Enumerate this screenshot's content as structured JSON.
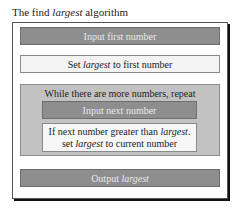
{
  "title": {
    "prefix": "The find ",
    "em": "largest",
    "suffix": " algorithm"
  },
  "steps": [
    {
      "label": "Input first number"
    },
    {
      "prefix": "Set ",
      "em": "largest",
      "suffix": " to first number"
    },
    {
      "loop_label": "While there are more numbers, repeat",
      "body": [
        {
          "label": "Input next number"
        },
        {
          "line1_prefix": "If next number greater than ",
          "line1_em": "largest",
          "line1_suffix": ".",
          "line2_prefix": "set ",
          "line2_em": "largest",
          "line2_suffix": " to current number"
        }
      ]
    },
    {
      "prefix": "Output ",
      "em": "largest"
    }
  ],
  "colors": {
    "dark_box": "#8e8e8e",
    "loop_box": "#c2c2c2",
    "light_box": "#f3f3f3",
    "shadow": "#111111"
  }
}
